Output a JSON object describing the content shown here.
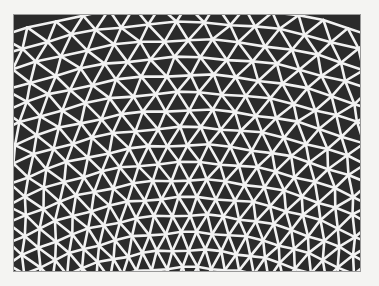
{
  "image": {
    "description": "Photograph of a lattice of white lines forming trapezoidal and triangular cells on a dark background, arranged in curved rows",
    "colors": {
      "page_background": "#f4f4f2",
      "cell_fill": "#2b2b2b",
      "line_color": "#f2f2f2",
      "frame_border": "#9a9a9a"
    },
    "pattern": {
      "rows": 15,
      "cells_per_row": 22,
      "curve_center_x": 175,
      "curve_center_y": 560,
      "line_width": 2.6
    }
  }
}
